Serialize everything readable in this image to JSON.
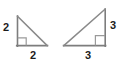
{
  "figure": {
    "type": "geometry-diagram",
    "background_color": "#ffffff",
    "stroke_color": "#7d7d7d",
    "label_color": "#1c1c1c",
    "shapes": [
      {
        "name": "left-triangle",
        "kind": "right-triangle",
        "right_angle_corner": "bottom-left",
        "vertices": {
          "top": [
            17,
            16
          ],
          "bottom_left": [
            17,
            46
          ],
          "bottom_right": [
            47,
            46
          ]
        },
        "right_angle_marker": {
          "x": 17,
          "y": 38,
          "size": 8
        },
        "labels": {
          "vertical_leg": "2",
          "horizontal_leg": "2"
        }
      },
      {
        "name": "right-triangle",
        "kind": "right-triangle",
        "right_angle_corner": "bottom-right",
        "vertices": {
          "top": [
            105,
            9
          ],
          "bottom_right": [
            105,
            46
          ],
          "bottom_left": [
            64,
            46
          ]
        },
        "right_angle_marker": {
          "x": 95,
          "y": 36,
          "size": 10
        },
        "labels": {
          "vertical_leg": "3",
          "horizontal_leg": "3"
        }
      }
    ]
  }
}
